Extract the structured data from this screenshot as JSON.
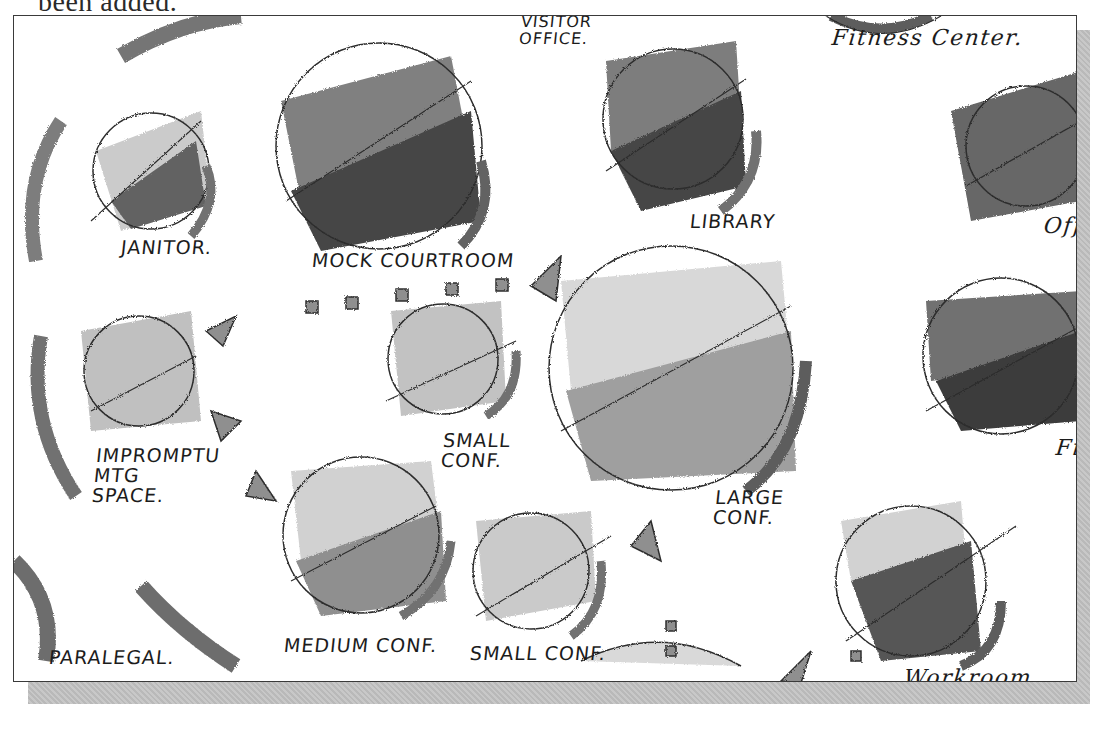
{
  "caption": {
    "text": "been added."
  },
  "diagram": {
    "type": "bubble-adjacency-sketch",
    "rendering": "grayscale marker sketch",
    "colors": {
      "ink": "#1c1c1c",
      "dark_marker": "#4a4a4a",
      "mid_marker": "#7a7a7a",
      "light_marker": "#c4c4c4",
      "frame_shadow": "#bdbdbd"
    },
    "rooms": [
      {
        "id": "janitor",
        "label": "JANITOR."
      },
      {
        "id": "mock-courtroom",
        "label": "MOCK COURTROOM"
      },
      {
        "id": "visitor-office",
        "label": "VISITOR OFFICE."
      },
      {
        "id": "library",
        "label": "LIBRARY"
      },
      {
        "id": "fitness-center",
        "label": "Fitness Center."
      },
      {
        "id": "office",
        "label": "Off"
      },
      {
        "id": "impromptu-mtg-space",
        "label": "IMPROMPTU MTG SPACE."
      },
      {
        "id": "small-conf-1",
        "label": "SMALL CONF."
      },
      {
        "id": "large-conf",
        "label": "LARGE CONF."
      },
      {
        "id": "file",
        "label": "Fil"
      },
      {
        "id": "medium-conf",
        "label": "MEDIUM CONF."
      },
      {
        "id": "small-conf-2",
        "label": "SMALL CONF."
      },
      {
        "id": "paralegal",
        "label": "PARALEGAL."
      },
      {
        "id": "workroom",
        "label": "Workroom."
      }
    ]
  }
}
